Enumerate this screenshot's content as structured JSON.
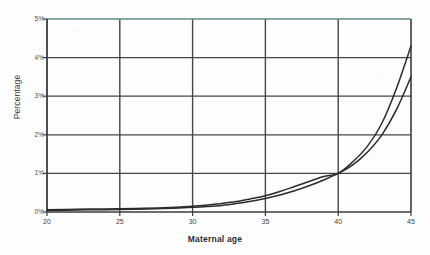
{
  "chart_data": {
    "type": "line",
    "title": "",
    "xlabel": "Maternal age",
    "ylabel": "Percentage",
    "xlim": [
      20,
      45
    ],
    "ylim": [
      0,
      5
    ],
    "grid": true,
    "legend": false,
    "xticks": [
      20,
      25,
      30,
      35,
      40,
      45
    ],
    "xticklabels": [
      "20",
      "25",
      "30",
      "35",
      "40",
      "45"
    ],
    "yticks": [
      0,
      1,
      2,
      3,
      4,
      5
    ],
    "yticklabels": [
      "0%",
      "1%",
      "2%",
      "3%",
      "4%",
      "5%"
    ],
    "x": [
      20,
      22,
      24,
      26,
      28,
      30,
      31,
      32,
      33,
      34,
      35,
      36,
      37,
      38,
      39,
      40,
      41,
      42,
      43,
      44,
      45
    ],
    "series": [
      {
        "name": "upper-curve",
        "color": "#2b2b2b",
        "values": [
          0.06,
          0.07,
          0.08,
          0.09,
          0.11,
          0.15,
          0.18,
          0.22,
          0.27,
          0.34,
          0.42,
          0.53,
          0.66,
          0.79,
          0.92,
          1.0,
          1.3,
          1.7,
          2.3,
          3.2,
          4.3
        ]
      },
      {
        "name": "lower-curve",
        "color": "#2b2b2b",
        "values": [
          0.04,
          0.05,
          0.06,
          0.07,
          0.09,
          0.12,
          0.14,
          0.17,
          0.22,
          0.28,
          0.35,
          0.44,
          0.55,
          0.68,
          0.83,
          1.0,
          1.22,
          1.55,
          2.0,
          2.65,
          3.5
        ]
      }
    ],
    "annotations": [],
    "colors": {
      "axis": "#3c3c3c",
      "grid": "#454545",
      "background": "#fdfdfd",
      "top_border_tint": "#5e8d84",
      "curve": "#2b2b2b"
    }
  }
}
